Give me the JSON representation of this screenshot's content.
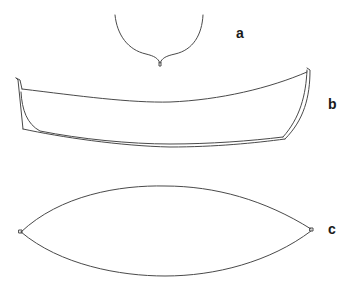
{
  "figure": {
    "panels": [
      {
        "id": "a",
        "label": "a",
        "description": "cross-section (U-shaped profile with keel cusp)"
      },
      {
        "id": "b",
        "label": "b",
        "description": "side view (hull profile with double-line bottom and stern)"
      },
      {
        "id": "c",
        "label": "c",
        "description": "plan view (lens-shaped outline with pointed ends)"
      }
    ],
    "colors": {
      "stroke": "#4a4a4a",
      "background": "#ffffff",
      "label": "#1a1a1a"
    }
  }
}
